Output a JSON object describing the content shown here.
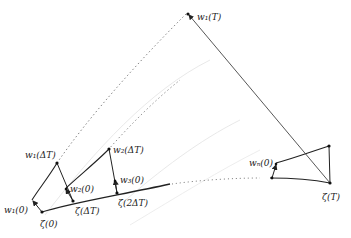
{
  "diagram": {
    "labels": {
      "w1_T": "w₁(T)",
      "w1_dT": "w₁(ΔT)",
      "w2_dT": "w₂(ΔT)",
      "w2_0": "w₂(0)",
      "w3_0": "w₃(0)",
      "w1_0": "w₁(0)",
      "zeta_0": "ζ(0)",
      "zeta_dT": "ζ(ΔT)",
      "zeta_2dT": "ζ(2ΔT)",
      "wn_0": "wₙ(0)",
      "zeta_T": "ζ(T)"
    },
    "colors": {
      "stroke": "#222222",
      "dotted": "#777777",
      "faint": "#dddddd"
    }
  }
}
